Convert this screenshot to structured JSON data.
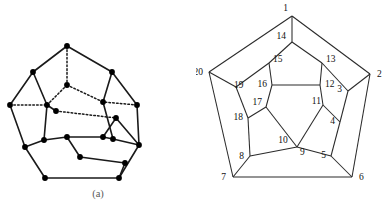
{
  "figure": {
    "title_a": "(a)",
    "title_b": "(b)",
    "background_color": "#ffffff",
    "line_color": "#1a1a1a",
    "vertex_color": "#000000",
    "label_color": "#111111"
  },
  "panel_a": {
    "caption": "(a)",
    "description": "dodecahedron-perspective-drawing",
    "vertex_count": 20,
    "solid_edge_count": 24,
    "dotted_edge_count": 6,
    "vertices": [
      {
        "id": 1,
        "x": 67,
        "y": 46
      },
      {
        "id": 2,
        "x": 33,
        "y": 72
      },
      {
        "id": 3,
        "x": 112,
        "y": 72
      },
      {
        "id": 4,
        "x": 10,
        "y": 105
      },
      {
        "id": 5,
        "x": 137,
        "y": 105
      },
      {
        "id": 6,
        "x": 25,
        "y": 147
      },
      {
        "id": 7,
        "x": 139,
        "y": 145
      },
      {
        "id": 8,
        "x": 45,
        "y": 178
      },
      {
        "id": 9,
        "x": 119,
        "y": 178
      },
      {
        "id": 10,
        "x": 125,
        "y": 163
      },
      {
        "id": 11,
        "x": 67,
        "y": 85
      },
      {
        "id": 12,
        "x": 47,
        "y": 105
      },
      {
        "id": 13,
        "x": 103,
        "y": 102
      },
      {
        "id": 14,
        "x": 44,
        "y": 140
      },
      {
        "id": 15,
        "x": 113,
        "y": 139
      },
      {
        "id": 16,
        "x": 67,
        "y": 137
      },
      {
        "id": 17,
        "x": 103,
        "y": 137
      },
      {
        "id": 18,
        "x": 80,
        "y": 157
      },
      {
        "id": 19,
        "x": 56,
        "y": 111
      },
      {
        "id": 20,
        "x": 116,
        "y": 118
      }
    ],
    "solid_edges": [
      [
        1,
        2
      ],
      [
        1,
        3
      ],
      [
        2,
        4
      ],
      [
        3,
        5
      ],
      [
        4,
        6
      ],
      [
        5,
        7
      ],
      [
        6,
        8
      ],
      [
        7,
        9
      ],
      [
        8,
        9
      ],
      [
        2,
        12
      ],
      [
        3,
        13
      ],
      [
        12,
        14
      ],
      [
        13,
        15
      ],
      [
        14,
        16
      ],
      [
        15,
        17
      ],
      [
        16,
        17
      ],
      [
        16,
        18
      ],
      [
        17,
        20
      ],
      [
        18,
        10
      ],
      [
        9,
        10
      ],
      [
        7,
        20
      ],
      [
        12,
        19
      ],
      [
        14,
        6
      ],
      [
        15,
        7
      ]
    ],
    "dotted_edges": [
      [
        1,
        11
      ],
      [
        11,
        12
      ],
      [
        11,
        13
      ],
      [
        4,
        12
      ],
      [
        5,
        13
      ],
      [
        19,
        20
      ]
    ]
  },
  "panel_b": {
    "caption": "(b)",
    "description": "dodecahedron-schlegel-diagram",
    "vertex_count": 20,
    "edge_count": 30,
    "vertex_labels": [
      "1",
      "2",
      "3",
      "4",
      "5",
      "6",
      "7",
      "8",
      "9",
      "10",
      "11",
      "12",
      "13",
      "14",
      "15",
      "16",
      "17",
      "18",
      "19",
      "20"
    ],
    "vertices": [
      {
        "id": 1,
        "label": "1",
        "x": 96,
        "y": 16,
        "lx": 92,
        "ly": 11,
        "anchor": "end"
      },
      {
        "id": 2,
        "label": "2",
        "x": 174,
        "y": 74,
        "lx": 181,
        "ly": 77,
        "anchor": "start"
      },
      {
        "id": 3,
        "label": "3",
        "x": 152,
        "y": 91,
        "lx": 146,
        "ly": 92,
        "anchor": "end"
      },
      {
        "id": 4,
        "label": "4",
        "x": 144,
        "y": 122,
        "lx": 139,
        "ly": 124,
        "anchor": "end"
      },
      {
        "id": 5,
        "label": "5",
        "x": 135,
        "y": 156,
        "lx": 130,
        "ly": 158,
        "anchor": "end"
      },
      {
        "id": 6,
        "label": "6",
        "x": 156,
        "y": 177,
        "lx": 163,
        "ly": 180,
        "anchor": "start"
      },
      {
        "id": 7,
        "label": "7",
        "x": 37,
        "y": 177,
        "lx": 30,
        "ly": 180,
        "anchor": "end"
      },
      {
        "id": 8,
        "label": "8",
        "x": 54,
        "y": 156,
        "lx": 48,
        "ly": 159,
        "anchor": "end"
      },
      {
        "id": 9,
        "label": "9",
        "x": 101,
        "y": 147,
        "lx": 104,
        "ly": 155,
        "anchor": "start"
      },
      {
        "id": 10,
        "label": "10",
        "x": 101,
        "y": 147,
        "lx": 87,
        "ly": 143,
        "anchor": "middle"
      },
      {
        "id": 11,
        "label": "11",
        "x": 127,
        "y": 105,
        "lx": 125,
        "ly": 104,
        "anchor": "end"
      },
      {
        "id": 12,
        "label": "12",
        "x": 124,
        "y": 85,
        "lx": 129,
        "ly": 87,
        "anchor": "start"
      },
      {
        "id": 13,
        "label": "13",
        "x": 126,
        "y": 63,
        "lx": 130,
        "ly": 62,
        "anchor": "start"
      },
      {
        "id": 14,
        "label": "14",
        "x": 96,
        "y": 42,
        "lx": 90,
        "ly": 39,
        "anchor": "end"
      },
      {
        "id": 15,
        "label": "15",
        "x": 73,
        "y": 63,
        "lx": 77,
        "ly": 62,
        "anchor": "start"
      },
      {
        "id": 16,
        "label": "16",
        "x": 76,
        "y": 85,
        "lx": 71,
        "ly": 87,
        "anchor": "end"
      },
      {
        "id": 17,
        "label": "17",
        "x": 70,
        "y": 107,
        "lx": 66,
        "ly": 105,
        "anchor": "end"
      },
      {
        "id": 18,
        "label": "18",
        "x": 52,
        "y": 118,
        "lx": 47,
        "ly": 120,
        "anchor": "end"
      },
      {
        "id": 19,
        "label": "19",
        "x": 40,
        "y": 87,
        "lx": 38,
        "ly": 88,
        "anchor": "start"
      },
      {
        "id": 20,
        "label": "20",
        "x": 13,
        "y": 72,
        "lx": 7,
        "ly": 75,
        "anchor": "end"
      }
    ],
    "edges": [
      [
        1,
        2
      ],
      [
        2,
        6
      ],
      [
        6,
        7
      ],
      [
        7,
        20
      ],
      [
        20,
        1
      ],
      [
        1,
        14
      ],
      [
        2,
        3
      ],
      [
        6,
        5
      ],
      [
        7,
        8
      ],
      [
        20,
        19
      ],
      [
        14,
        13
      ],
      [
        14,
        15
      ],
      [
        3,
        13
      ],
      [
        3,
        4
      ],
      [
        5,
        4
      ],
      [
        5,
        9
      ],
      [
        8,
        9
      ],
      [
        8,
        18
      ],
      [
        19,
        18
      ],
      [
        19,
        15
      ],
      [
        13,
        12
      ],
      [
        15,
        16
      ],
      [
        4,
        11
      ],
      [
        9,
        10
      ],
      [
        18,
        17
      ],
      [
        12,
        11
      ],
      [
        11,
        10
      ],
      [
        10,
        17
      ],
      [
        17,
        16
      ],
      [
        16,
        12
      ]
    ]
  }
}
